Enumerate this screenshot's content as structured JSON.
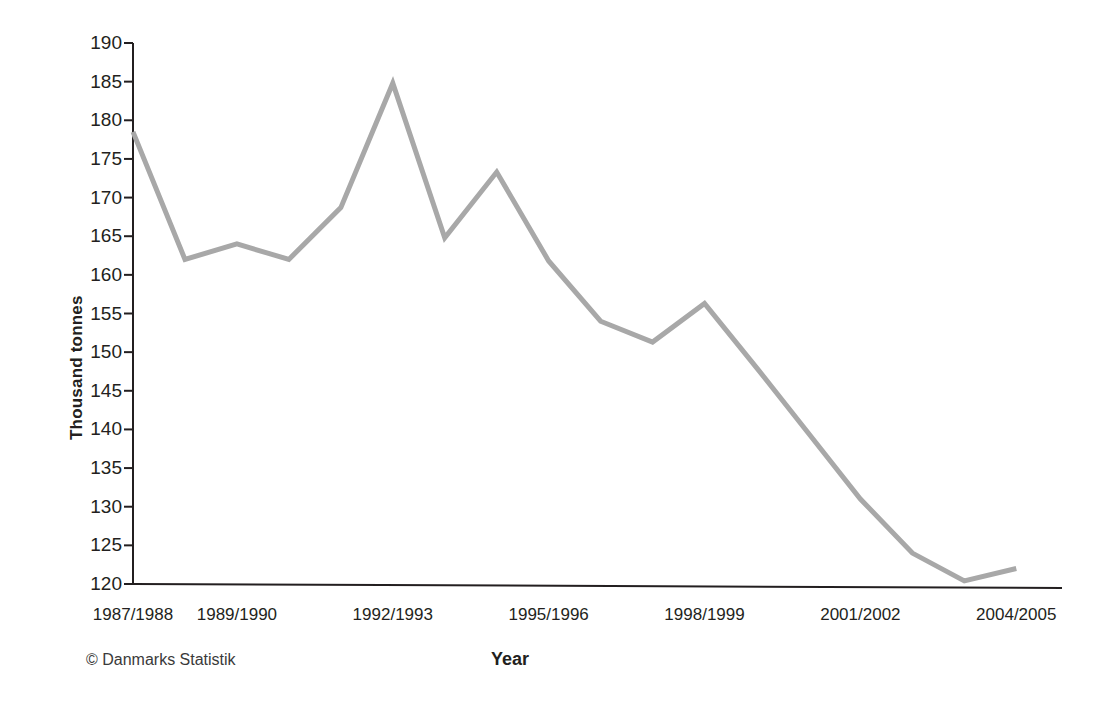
{
  "chart_data": {
    "type": "line",
    "title": "",
    "subtitle": "",
    "xlabel": "Year",
    "ylabel": "Thousand tonnes",
    "credit": "© Danmarks Statistik",
    "grid": false,
    "legend_position": "none",
    "line_color": "#a8a8a8",
    "axis_color": "#231f20",
    "ylim": [
      120,
      190
    ],
    "ytick_step": 5,
    "ytick_labels": [
      "190",
      "185",
      "180",
      "175",
      "170",
      "165",
      "160",
      "155",
      "150",
      "145",
      "140",
      "135",
      "130",
      "125",
      "120"
    ],
    "ytick_values": [
      190,
      185,
      180,
      175,
      170,
      165,
      160,
      155,
      150,
      145,
      140,
      135,
      130,
      125,
      120
    ],
    "categories": [
      "1987/1988",
      "1988/1989",
      "1989/1990",
      "1990/1991",
      "1991/1992",
      "1992/1993",
      "1993/1994",
      "1994/1995",
      "1995/1996",
      "1996/1997",
      "1997/1998",
      "1998/1999",
      "1999/2000",
      "2000/2001",
      "2001/2002",
      "2002/2003",
      "2003/2004",
      "2004/2005"
    ],
    "xtick_labels": [
      "1987/1988",
      "1989/1990",
      "1992/1993",
      "1995/1996",
      "1998/1999",
      "2001/2002",
      "2004/2005"
    ],
    "xtick_category_index": [
      0,
      2,
      5,
      8,
      11,
      14,
      17
    ],
    "values": [
      178.5,
      162.0,
      164.0,
      162.0,
      168.7,
      184.8,
      164.8,
      173.3,
      161.8,
      154.0,
      151.3,
      156.3,
      148.0,
      139.5,
      131.0,
      124.0,
      120.4,
      122.0
    ],
    "series": [
      {
        "name": "Thousand tonnes",
        "values": [
          178.5,
          162.0,
          164.0,
          162.0,
          168.7,
          184.8,
          164.8,
          173.3,
          161.8,
          154.0,
          151.3,
          156.3,
          148.0,
          139.5,
          131.0,
          124.0,
          120.4,
          122.0
        ]
      }
    ]
  }
}
